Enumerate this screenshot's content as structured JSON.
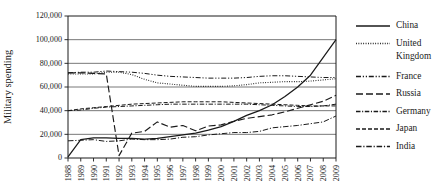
{
  "chart_data": {
    "type": "line",
    "title": "",
    "xlabel": "",
    "ylabel": "Military spending",
    "grid": true,
    "legend_position": "right",
    "xlim": [
      1988,
      2009
    ],
    "ylim": [
      0,
      120000
    ],
    "x": [
      1988,
      1989,
      1990,
      1991,
      1992,
      1993,
      1994,
      1995,
      1996,
      1997,
      1998,
      1999,
      2000,
      2001,
      2002,
      2003,
      2004,
      2005,
      2006,
      2007,
      2008,
      2009
    ],
    "categories": [
      "1988",
      "1989",
      "1990",
      "1991",
      "1992",
      "1993",
      "1994",
      "1995",
      "1996",
      "1997",
      "1998",
      "1999",
      "2000",
      "2001",
      "2002",
      "2003",
      "2004",
      "2005",
      "2006",
      "2007",
      "2008",
      "2009"
    ],
    "ytick_labels": [
      "0",
      "20,000",
      "40,000",
      "60,000",
      "80,000",
      "100,000",
      "120,000"
    ],
    "ytick_values": [
      0,
      20000,
      40000,
      60000,
      80000,
      100000,
      120000
    ],
    "series": [
      {
        "name": "China",
        "style": "solid",
        "values": [
          1000,
          15500,
          17000,
          17000,
          16500,
          16500,
          16000,
          16500,
          18000,
          19500,
          21000,
          23500,
          26500,
          31000,
          36000,
          40000,
          45000,
          52000,
          60000,
          70000,
          85000,
          100000
        ]
      },
      {
        "name": "United Kingdom",
        "style": "dotted",
        "values": [
          71000,
          71000,
          71000,
          72500,
          72500,
          70500,
          66500,
          63500,
          62500,
          61500,
          60500,
          60500,
          60500,
          61000,
          62000,
          63500,
          64000,
          64500,
          64500,
          65000,
          66000,
          67000
        ]
      },
      {
        "name": "France",
        "style": "dash-dot-dot",
        "values": [
          72000,
          72500,
          72500,
          73500,
          73000,
          72500,
          71500,
          70000,
          69000,
          68500,
          68000,
          67500,
          67500,
          67500,
          68000,
          69000,
          69500,
          69500,
          69000,
          68500,
          68000,
          68000
        ]
      },
      {
        "name": "Russia",
        "style": "dashed-long",
        "values": [
          72000,
          72000,
          71500,
          71000,
          2000,
          21000,
          22500,
          30500,
          26000,
          27500,
          23000,
          27000,
          28000,
          31000,
          33500,
          35000,
          36500,
          39000,
          42000,
          45000,
          48000,
          53000
        ]
      },
      {
        "name": "Germany",
        "style": "dash-dot",
        "values": [
          40000,
          40500,
          42000,
          43000,
          43500,
          44000,
          44500,
          45000,
          45500,
          45500,
          45500,
          45500,
          45500,
          45500,
          45500,
          45000,
          44500,
          44000,
          43500,
          43500,
          44000,
          45500
        ]
      },
      {
        "name": "Japan",
        "style": "dashed-short",
        "values": [
          40000,
          41500,
          42500,
          43500,
          44500,
          45500,
          46000,
          46500,
          47000,
          47500,
          47500,
          47500,
          47500,
          47000,
          46500,
          46000,
          45500,
          45000,
          44500,
          44000,
          44000,
          44000
        ]
      },
      {
        "name": "India",
        "style": "dash-dot-alt",
        "values": [
          14500,
          15000,
          15500,
          14000,
          14500,
          16000,
          15500,
          15500,
          16000,
          17500,
          18000,
          19500,
          20500,
          21500,
          21500,
          22500,
          25500,
          26500,
          27500,
          29000,
          30500,
          35500
        ]
      }
    ]
  }
}
